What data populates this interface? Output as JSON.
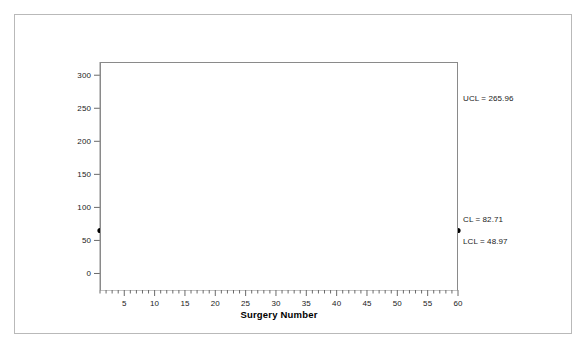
{
  "chart_data": {
    "type": "line",
    "title": "",
    "xlabel": "Surgery Number",
    "ylabel": "Surgery Time, Minutes",
    "xlim": [
      1,
      60
    ],
    "ylim": [
      -25,
      320
    ],
    "grid": false,
    "legend": "none",
    "x_tick_labels": [
      "5",
      "10",
      "15",
      "20",
      "25",
      "30",
      "35",
      "40",
      "45",
      "50",
      "55",
      "60"
    ],
    "x_ticks": [
      5,
      10,
      15,
      20,
      25,
      30,
      35,
      40,
      45,
      50,
      55,
      60
    ],
    "x_minor_tick_step": 1,
    "y_tick_labels": [
      "0",
      "50",
      "100",
      "150",
      "200",
      "250",
      "300"
    ],
    "y_ticks": [
      0,
      50,
      100,
      150,
      200,
      250,
      300
    ],
    "marker": "filled-circle",
    "marker_color": "#000000",
    "line_color": "#555555",
    "categories": [
      1,
      2,
      3,
      4,
      5,
      6,
      7,
      8,
      9,
      10,
      11,
      12,
      13,
      14,
      15,
      16,
      17,
      18,
      19,
      20,
      21,
      22,
      23,
      24,
      25,
      26,
      27,
      28,
      29,
      30,
      31,
      32,
      33,
      34,
      35,
      36,
      37,
      38,
      39,
      40,
      41,
      42,
      43,
      44,
      45,
      46,
      47,
      48,
      49,
      50,
      51,
      52,
      53,
      54,
      55,
      56,
      57,
      58,
      59,
      60
    ],
    "values": [
      65,
      76,
      76,
      60,
      165,
      76,
      85,
      86,
      81,
      96,
      66,
      66,
      86,
      68,
      190,
      121,
      105,
      115,
      59,
      70,
      80,
      75,
      66,
      75,
      91,
      74,
      67,
      50,
      80,
      76,
      80,
      115,
      76,
      96,
      130,
      126,
      105,
      70,
      72,
      95,
      90,
      120,
      76,
      91,
      86,
      91,
      80,
      115,
      80,
      65,
      70,
      184,
      76,
      91,
      120,
      130,
      65,
      65,
      115,
      65
    ],
    "control_limits": {
      "ucl": 265.96,
      "cl": 82.71,
      "lcl": 48.97,
      "ucl_label": "UCL = 265.96",
      "cl_label": "CL = 82.71",
      "lcl_label": "LCL = 48.97",
      "ucl_style": "dashed",
      "cl_style": "solid",
      "lcl_style": "dashed",
      "limit_color": "#777777",
      "center_color": "#555555"
    }
  }
}
